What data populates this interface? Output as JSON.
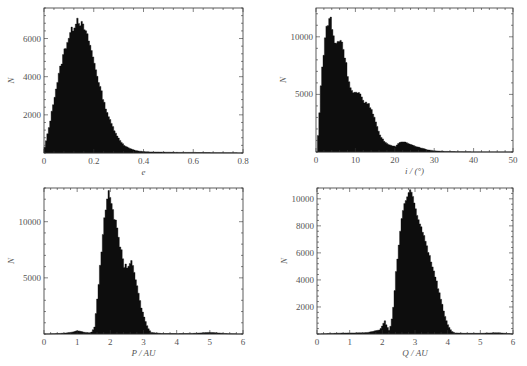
{
  "chart_data": [
    {
      "id": "e",
      "type": "bar",
      "title": "",
      "xlabel": "e",
      "ylabel": "N",
      "xlim": [
        0,
        0.8
      ],
      "ylim": [
        0,
        7600
      ],
      "xticks": [
        0,
        0.2,
        0.4,
        0.6,
        0.8
      ],
      "xtick_labels": [
        "0",
        "0.2",
        "0.4",
        "0.6",
        "0.8"
      ],
      "yticks": [
        2000,
        4000,
        6000
      ],
      "ytick_labels": [
        "2000",
        "4000",
        "6000"
      ],
      "grid": false,
      "x": [
        0.0,
        0.02,
        0.04,
        0.06,
        0.08,
        0.1,
        0.12,
        0.13,
        0.14,
        0.16,
        0.18,
        0.2,
        0.22,
        0.24,
        0.26,
        0.28,
        0.3,
        0.32,
        0.34,
        0.36,
        0.38,
        0.4,
        0.45,
        0.5,
        0.55,
        0.6,
        0.65,
        0.7,
        0.75,
        0.8
      ],
      "values": [
        300,
        1500,
        3000,
        4300,
        5400,
        6200,
        6700,
        7100,
        6900,
        6500,
        5800,
        4700,
        3600,
        2600,
        1800,
        1200,
        700,
        400,
        250,
        150,
        100,
        70,
        50,
        40,
        30,
        30,
        20,
        15,
        10,
        5
      ]
    },
    {
      "id": "i",
      "type": "bar",
      "title": "",
      "xlabel": "i / (°)",
      "ylabel": "N",
      "xlim": [
        0,
        50
      ],
      "ylim": [
        0,
        12500
      ],
      "xticks": [
        0,
        10,
        20,
        30,
        40,
        50
      ],
      "xtick_labels": [
        "0",
        "10",
        "20",
        "30",
        "40",
        "50"
      ],
      "yticks": [
        5000,
        10000
      ],
      "ytick_labels": [
        "5000",
        "10000"
      ],
      "grid": false,
      "x": [
        0,
        0.5,
        1,
        1.5,
        2,
        2.5,
        3,
        3.5,
        4,
        4.5,
        5,
        5.5,
        6,
        6.5,
        7,
        7.5,
        8,
        9,
        10,
        11,
        12,
        13,
        14,
        15,
        16,
        17,
        18,
        19,
        20,
        21,
        22,
        23,
        24,
        25,
        26,
        27,
        28,
        29,
        30,
        32,
        35,
        40,
        45,
        50
      ],
      "values": [
        0,
        2000,
        5500,
        7500,
        9500,
        10800,
        11200,
        12000,
        10500,
        9500,
        9400,
        9600,
        9800,
        9500,
        8600,
        7600,
        6400,
        5200,
        5100,
        5000,
        4400,
        4200,
        3700,
        2600,
        1500,
        1000,
        700,
        550,
        500,
        800,
        900,
        800,
        650,
        500,
        400,
        300,
        200,
        150,
        100,
        60,
        30,
        10,
        5,
        0
      ]
    },
    {
      "id": "P",
      "type": "bar",
      "title": "",
      "xlabel": "P / AU",
      "ylabel": "N",
      "xlim": [
        0,
        6
      ],
      "ylim": [
        0,
        13000
      ],
      "xticks": [
        0,
        1,
        2,
        3,
        4,
        5,
        6
      ],
      "xtick_labels": [
        "0",
        "1",
        "2",
        "3",
        "4",
        "5",
        "6"
      ],
      "yticks": [
        5000,
        10000
      ],
      "ytick_labels": [
        "5000",
        "10000"
      ],
      "grid": false,
      "x": [
        0,
        0.2,
        0.4,
        0.6,
        0.8,
        1.0,
        1.2,
        1.4,
        1.5,
        1.6,
        1.7,
        1.8,
        1.9,
        1.95,
        2.0,
        2.1,
        2.2,
        2.3,
        2.4,
        2.5,
        2.6,
        2.7,
        2.8,
        2.9,
        3.0,
        3.1,
        3.2,
        3.5,
        4.0,
        4.5,
        5.0,
        5.5,
        6.0
      ],
      "values": [
        0,
        20,
        40,
        80,
        150,
        300,
        150,
        100,
        600,
        3500,
        7000,
        10500,
        12300,
        12500,
        12000,
        10500,
        9000,
        7500,
        6100,
        6000,
        6500,
        5500,
        4000,
        2500,
        1500,
        600,
        150,
        50,
        30,
        60,
        150,
        30,
        0
      ]
    },
    {
      "id": "Q",
      "type": "bar",
      "title": "",
      "xlabel": "Q / AU",
      "ylabel": "N",
      "xlim": [
        0,
        6
      ],
      "ylim": [
        0,
        10800
      ],
      "xticks": [
        0,
        1,
        2,
        3,
        4,
        5,
        6
      ],
      "xtick_labels": [
        "0",
        "1",
        "2",
        "3",
        "4",
        "5",
        "6"
      ],
      "yticks": [
        2000,
        4000,
        6000,
        8000,
        10000
      ],
      "ytick_labels": [
        "2000",
        "4000",
        "6000",
        "8000",
        "10000"
      ],
      "grid": false,
      "x": [
        0,
        0.5,
        1.0,
        1.5,
        1.9,
        2.0,
        2.05,
        2.1,
        2.2,
        2.3,
        2.4,
        2.5,
        2.6,
        2.7,
        2.8,
        2.85,
        2.9,
        3.0,
        3.1,
        3.2,
        3.3,
        3.4,
        3.5,
        3.6,
        3.7,
        3.8,
        3.9,
        4.0,
        4.1,
        4.2,
        4.5,
        5.0,
        5.5,
        6.0
      ],
      "values": [
        0,
        50,
        80,
        100,
        300,
        700,
        1000,
        700,
        200,
        1500,
        4500,
        7000,
        9000,
        10000,
        10500,
        10800,
        10200,
        9000,
        8300,
        7700,
        7000,
        6000,
        5200,
        4300,
        3300,
        2300,
        1300,
        600,
        200,
        80,
        50,
        50,
        100,
        0
      ]
    }
  ]
}
